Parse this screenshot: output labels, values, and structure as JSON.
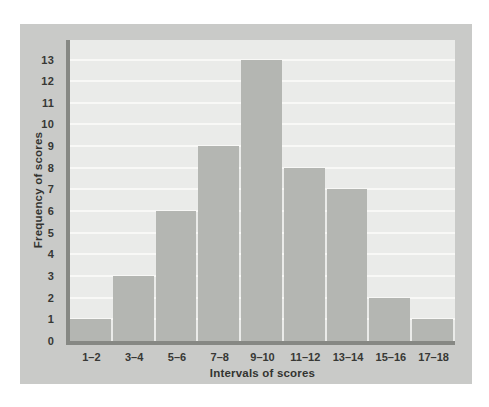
{
  "figure": {
    "background": "#ffffff",
    "panel_color": "#c9cac8",
    "plot_background": "#eaebe9",
    "gridline_color": "#f8f8f6",
    "bar_color": "#b4b6b2",
    "axis_line_color": "#868884",
    "text_color": "#373835"
  },
  "chart_data": {
    "type": "bar",
    "title": "",
    "xlabel": "Intervals of scores",
    "ylabel": "Frequency of scores",
    "categories": [
      "1–2",
      "3–4",
      "5–6",
      "7–8",
      "9–10",
      "11–12",
      "13–14",
      "15–16",
      "17–18"
    ],
    "values": [
      1,
      3,
      6,
      9,
      13,
      8,
      7,
      2,
      1
    ],
    "yticks": [
      "0",
      "1",
      "2",
      "3",
      "4",
      "5",
      "6",
      "7",
      "8",
      "9",
      "10",
      "11",
      "12",
      "13"
    ],
    "ylim": [
      0,
      13
    ],
    "grid": true,
    "legend_position": "none"
  }
}
